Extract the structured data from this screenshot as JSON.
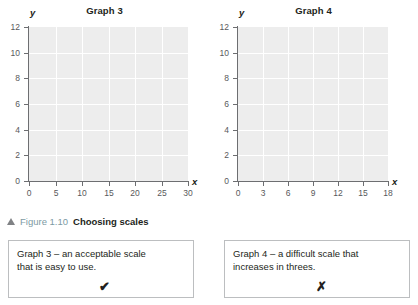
{
  "figure": {
    "caption_marker": "triangle-up",
    "caption_number": "Figure 1.10",
    "caption_title": "Choosing scales",
    "caption_number_color": "#7d9aa3"
  },
  "graphs": [
    {
      "title": "Graph 3",
      "x_axis_name": "x",
      "y_axis_name": "y",
      "x_ticks": [
        "0",
        "5",
        "10",
        "15",
        "20",
        "25",
        "30"
      ],
      "y_ticks": [
        "0",
        "2",
        "4",
        "6",
        "8",
        "10",
        "12"
      ],
      "x_min": 0,
      "x_max": 30,
      "x_step": 5,
      "y_min": 0,
      "y_max": 12,
      "y_step": 2
    },
    {
      "title": "Graph 4",
      "x_axis_name": "x",
      "y_axis_name": "y",
      "x_ticks": [
        "0",
        "3",
        "6",
        "9",
        "12",
        "15",
        "18"
      ],
      "y_ticks": [
        "0",
        "2",
        "4",
        "6",
        "8",
        "10",
        "12"
      ],
      "x_min": 0,
      "x_max": 18,
      "x_step": 3,
      "y_min": 0,
      "y_max": 12,
      "y_step": 2
    }
  ],
  "notes": [
    {
      "line1": "Graph 3 – an acceptable scale",
      "line2": "that is easy to use.",
      "mark": "✔",
      "mark_name": "check-mark"
    },
    {
      "line1": "Graph 4 – a difficult scale that",
      "line2": "increases in threes.",
      "mark": "✗",
      "mark_name": "cross-mark"
    }
  ],
  "chart_data": [
    {
      "type": "line",
      "title": "Graph 3",
      "xlabel": "x",
      "ylabel": "y",
      "xlim": [
        0,
        30
      ],
      "ylim": [
        0,
        12
      ],
      "xticks": [
        0,
        5,
        10,
        15,
        20,
        25,
        30
      ],
      "yticks": [
        0,
        2,
        4,
        6,
        8,
        10,
        12
      ],
      "grid": true,
      "series": [],
      "annotation": "Empty grid — blank axes showing an acceptable scale (steps of 5 on x, 2 on y)"
    },
    {
      "type": "line",
      "title": "Graph 4",
      "xlabel": "x",
      "ylabel": "y",
      "xlim": [
        0,
        18
      ],
      "ylim": [
        0,
        12
      ],
      "xticks": [
        0,
        3,
        6,
        9,
        12,
        15,
        18
      ],
      "yticks": [
        0,
        2,
        4,
        6,
        8,
        10,
        12
      ],
      "grid": true,
      "series": [],
      "annotation": "Empty grid — blank axes showing a difficult scale (steps of 3 on x, 2 on y)"
    }
  ]
}
